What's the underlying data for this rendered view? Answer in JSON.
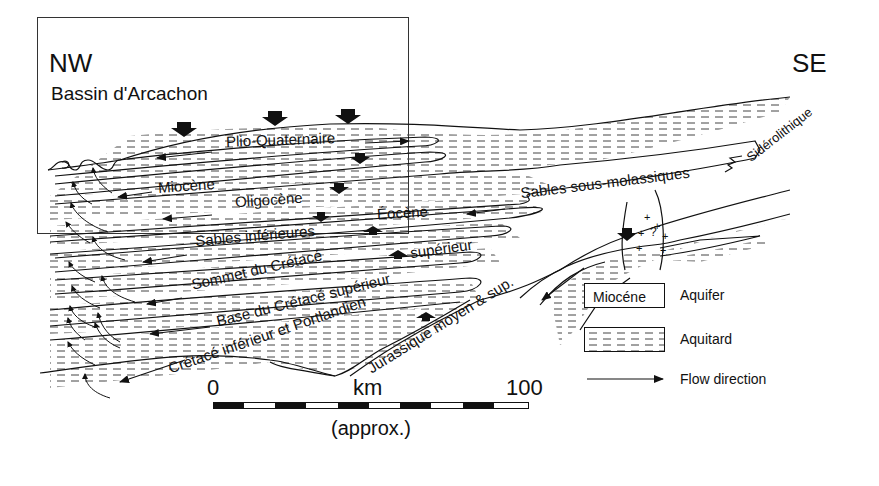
{
  "diagram": {
    "orientation": {
      "left": "NW",
      "right": "SE",
      "left_subtitle": "Bassin d'Arcachon"
    },
    "units": [
      {
        "name": "Plio-Quaternaire",
        "type": "aquifer"
      },
      {
        "name": "Miocène",
        "type": "aquifer"
      },
      {
        "name": "Oligocène",
        "type": "aquifer"
      },
      {
        "name": "Éocène",
        "type": "aquifer"
      },
      {
        "name": "Sables inférieures",
        "type": "aquifer"
      },
      {
        "name": "Sommet du Crétacé supérieur",
        "type": "aquifer"
      },
      {
        "name": "Base du Crétacé supérieur",
        "type": "aquifer"
      },
      {
        "name": "Crétacé inférieur et Portlandien",
        "type": "aquifer"
      },
      {
        "name": "Jurassique moyen & sup.",
        "type": "aquifer"
      },
      {
        "name": "Sables sous-molassiques",
        "type": "aquifer"
      },
      {
        "name": "Sidérolithique",
        "type": "aquifer"
      }
    ],
    "labels": {
      "plio": "Plio-Quaternaire",
      "miocene": "Miocène",
      "oligocene": "Oligocène",
      "eocene": "Éocène",
      "sables_inf": "Sables inférieures",
      "sommet": "Sommet du Crétacé",
      "superieur": "supérieur",
      "base": "Base du Crétacé supérieur",
      "cretace_inf": "Crétacé inférieur et Portlandien",
      "jurassique": "Jurassique moyen & sup.",
      "sables_sous": "Sables sous-molassiques",
      "siderolithique": "Sidérolithique",
      "basement_mark": "?"
    },
    "scale": {
      "start": "0",
      "end": "100",
      "unit": "km",
      "note": "(approx.)"
    },
    "legend": {
      "aquifer_sample": "Miocéne",
      "aquifer_label": "Aquifer",
      "aquitard_label": "Aquitard",
      "flow_label": "Flow direction"
    }
  }
}
